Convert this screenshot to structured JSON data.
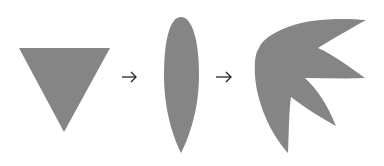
{
  "diagram": {
    "fill_color": "#858585",
    "arrow_color": "#222222",
    "steps": [
      {
        "shape": "inverted-triangle"
      },
      {
        "connector": "right-arrow",
        "glyph": "→"
      },
      {
        "shape": "elongated-ellipse"
      },
      {
        "connector": "right-arrow",
        "glyph": "→"
      },
      {
        "shape": "multi-petal-leaf"
      }
    ]
  }
}
